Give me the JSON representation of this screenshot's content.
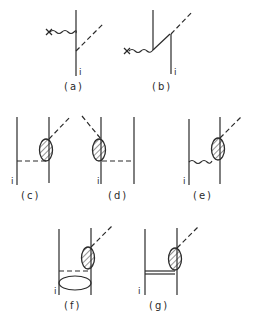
{
  "figure": {
    "title": "",
    "diagrams": [
      {
        "id": "a",
        "label": "(a)",
        "index_label": "i"
      },
      {
        "id": "b",
        "label": "(b)",
        "index_label": "i"
      },
      {
        "id": "c",
        "label": "(c)",
        "index_label": "i"
      },
      {
        "id": "d",
        "label": "(d)",
        "index_label": "i"
      },
      {
        "id": "e",
        "label": "(e)",
        "index_label": "i"
      },
      {
        "id": "f",
        "label": "(f)",
        "index_label": "i"
      },
      {
        "id": "g",
        "label": "(g)",
        "index_label": "i"
      }
    ],
    "colors": {
      "ink": "#2a2a2a",
      "background": "#ffffff"
    },
    "elements": {
      "external_source_marker": "x",
      "line_styles": [
        "solid",
        "dashed",
        "wavy",
        "double",
        "hatched-blob",
        "loop-ellipse"
      ]
    }
  }
}
